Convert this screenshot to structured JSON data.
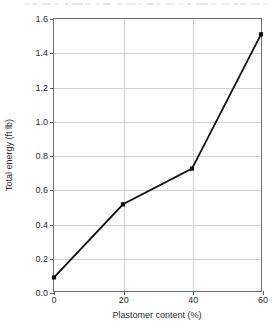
{
  "figure": {
    "background_color": "#ffffff",
    "line_color": "#111111",
    "grid_color": "#d2d2d6",
    "frame_color": "#6e6e72",
    "text_color": "#2a2a2e"
  },
  "scan_artifact": {
    "description": "faint clipped text line at top edge of scanned page",
    "visible": true
  },
  "chart_data": {
    "type": "line",
    "title": "",
    "xlabel": "Plastomer content (%)",
    "ylabel": "Total energy (ft lb)",
    "x": [
      0,
      20,
      40,
      60
    ],
    "values": [
      0.08,
      0.51,
      0.72,
      1.51
    ],
    "series": [
      {
        "name": "Total energy",
        "x": [
          0,
          20,
          40,
          60
        ],
        "values": [
          0.08,
          0.51,
          0.72,
          1.51
        ]
      }
    ],
    "xlim": [
      0,
      60
    ],
    "ylim": [
      0.0,
      1.6
    ],
    "xticks": [
      0,
      20,
      40,
      60
    ],
    "yticks": [
      0.0,
      0.2,
      0.4,
      0.6,
      0.8,
      1.0,
      1.2,
      1.4,
      1.6
    ],
    "xticklabels": [
      "0",
      "20",
      "40",
      "60"
    ],
    "yticklabels": [
      "0.0",
      "0.2",
      "0.4",
      "0.6",
      "0.8",
      "1.0",
      "1.2",
      "1.4",
      "1.6"
    ],
    "grid": true,
    "grid_axis": "both",
    "legend": false,
    "legend_position": "none",
    "marker": "square",
    "marker_color": "#111111",
    "line_style": "solid"
  }
}
